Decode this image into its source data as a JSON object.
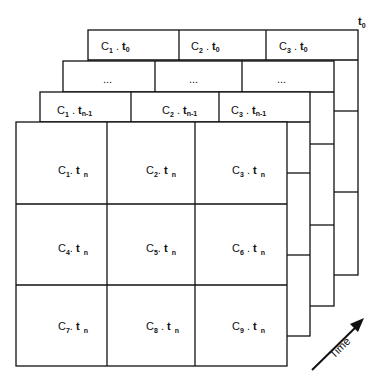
{
  "diagram": {
    "t0_label": "t",
    "t0_sub": "0",
    "time_label": "Time",
    "layers": [
      {
        "name": "t0",
        "cells": [
          {
            "c": "C",
            "cs": "1",
            "t": "t",
            "ts": "0"
          },
          {
            "c": "C",
            "cs": "2",
            "t": "t",
            "ts": "0"
          },
          {
            "c": "C",
            "cs": "3",
            "t": "t",
            "ts": "0"
          }
        ]
      },
      {
        "name": "ellipsis",
        "cells": [
          {
            "text": "..."
          },
          {
            "text": "..."
          },
          {
            "text": "..."
          }
        ]
      },
      {
        "name": "tn-1",
        "cells": [
          {
            "c": "C",
            "cs": "1",
            "t": "t",
            "ts": "n-1"
          },
          {
            "c": "C",
            "cs": "2",
            "t": "t",
            "ts": "n-1"
          },
          {
            "c": "C",
            "cs": "3",
            "t": "t",
            "ts": "n-1"
          }
        ]
      }
    ],
    "front": [
      {
        "c": "C",
        "cs": "1",
        "t": "t",
        "ts": "n"
      },
      {
        "c": "C",
        "cs": "2",
        "t": "t",
        "ts": "n"
      },
      {
        "c": "C",
        "cs": "3",
        "t": "t",
        "ts": "n"
      },
      {
        "c": "C",
        "cs": "4",
        "t": "t",
        "ts": "n"
      },
      {
        "c": "C",
        "cs": "5",
        "t": "t",
        "ts": "n"
      },
      {
        "c": "C",
        "cs": "6",
        "t": "t",
        "ts": "n"
      },
      {
        "c": "C",
        "cs": "7",
        "t": "t",
        "ts": "n"
      },
      {
        "c": "C",
        "cs": "8",
        "t": "t",
        "ts": "n"
      },
      {
        "c": "C",
        "cs": "9",
        "t": "t",
        "ts": "n"
      }
    ]
  }
}
